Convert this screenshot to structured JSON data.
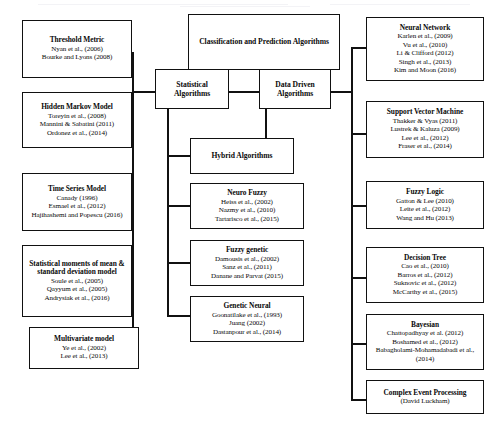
{
  "diagram": {
    "type": "tree-hierarchy",
    "root": {
      "id": "classification-and-prediction-algorithms",
      "title": "Classification and Prediction Algorithms"
    },
    "branches": [
      {
        "id": "statistical-algorithms",
        "title": "Statistical Algorithms"
      },
      {
        "id": "data-driven-algorithms",
        "title": "Data Driven Algorithms"
      },
      {
        "id": "hybrid-algorithms",
        "title": "Hybrid Algorithms"
      }
    ],
    "statistical_children": [
      {
        "id": "threshold-metric",
        "title": "Threshold Metric",
        "refs": [
          "Nyan et al., (2006)",
          "Bourke and Lyons (2008)"
        ]
      },
      {
        "id": "hidden-markov-model",
        "title": "Hidden Markov Model",
        "refs": [
          "Toreyin et al., (2008)",
          "Mannini & Sabatini (2011)",
          "Ordonez et al., (2014)"
        ]
      },
      {
        "id": "time-series-model",
        "title": "Time Series Model",
        "refs": [
          "Canady (1996)",
          "Esmael et al., (2012)",
          "Hajihashemi and Popescu (2016)"
        ]
      },
      {
        "id": "statistical-moments-model",
        "title": "Statistical moments of mean & standard deviation model",
        "refs": [
          "Soule et al., (2005)",
          "Qayyum et al., (2005)",
          "Andrysiak et al., (2016)"
        ]
      },
      {
        "id": "multivariate-model",
        "title": "Multivariate model",
        "refs": [
          "Ye et al., (2002)",
          "Lee et al., (2013)"
        ]
      }
    ],
    "hybrid_children": [
      {
        "id": "neuro-fuzzy",
        "title": "Neuro Fuzzy",
        "refs": [
          "Heiss et al., (2002)",
          "Nazmy et al., (2010)",
          "Tartarisco et al., (2015)"
        ]
      },
      {
        "id": "fuzzy-genetic",
        "title": "Fuzzy genetic",
        "refs": [
          "Damousis et al., (2002)",
          "Sanz et al., (2011)",
          "Danane and Parvat (2015)"
        ]
      },
      {
        "id": "genetic-neural",
        "title": "Genetic Neural",
        "refs": [
          "Goonatilake et al., (1993)",
          "Juang (2002)",
          "Dastanpour et al., (2014)"
        ]
      }
    ],
    "data_driven_children": [
      {
        "id": "neural-network",
        "title": "Neural Network",
        "refs": [
          "Karlen et al., (2009)",
          "Vu et al., (2010)",
          "Li & Clifford (2012)",
          "Singh et al., (2013)",
          "Kim and Moon (2016)"
        ]
      },
      {
        "id": "support-vector-machine",
        "title": "Support Vector Machine",
        "refs": [
          "Thakker & Vyas (2011)",
          "Lustrek & Kaluza (2009)",
          "Lee et al., (2012)",
          "Fraser et al., (2014)"
        ]
      },
      {
        "id": "fuzzy-logic",
        "title": "Fuzzy Logic",
        "refs": [
          "Gatton & Lee (2010)",
          "Leite et al., (2012)",
          "Wang and Hu (2013)"
        ]
      },
      {
        "id": "decision-tree",
        "title": "Decision Tree",
        "refs": [
          "Cao et al., (2010)",
          "Barros et al., (2012)",
          "Suknovic et al., (2012)",
          "McCarthy et al., (2015)"
        ]
      },
      {
        "id": "bayesian",
        "title": "Bayesian",
        "refs": [
          "Chattopadhyay et al. (2012)",
          "Boshamed et al., (2012)",
          "Babagholami-Mohamadabadi et al., (2014)"
        ]
      },
      {
        "id": "complex-event-processing",
        "title": "Complex Event Processing",
        "refs": [
          "(David Luckham)"
        ]
      }
    ],
    "colors": {
      "stroke": "#111111",
      "background": "#ffffff",
      "text": "#0a0a0a"
    }
  }
}
